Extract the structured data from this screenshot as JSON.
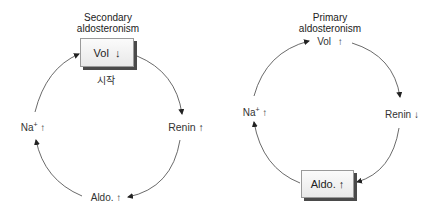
{
  "diagrams": [
    {
      "title_line1": "Secondary",
      "title_line2": "aldosteronism",
      "start_label": "시작",
      "nodes": {
        "vol": {
          "name": "Vol",
          "arrow": "↓",
          "boxed": true
        },
        "renin": {
          "name": "Renin",
          "arrow": "↑",
          "boxed": false
        },
        "aldo": {
          "name": "Aldo.",
          "arrow": "↑",
          "boxed": false
        },
        "na": {
          "name": "Na",
          "superscript": "+",
          "arrow": "↑",
          "boxed": false
        }
      },
      "cycle_order": [
        "vol",
        "renin",
        "aldo",
        "na"
      ]
    },
    {
      "title_line1": "Primary",
      "title_line2": "aldosteronism",
      "nodes": {
        "vol": {
          "name": "Vol",
          "arrow": "↑",
          "boxed": false
        },
        "renin": {
          "name": "Renin",
          "arrow": "↓",
          "boxed": false
        },
        "aldo": {
          "name": "Aldo.",
          "arrow": "↑",
          "boxed": true
        },
        "na": {
          "name": "Na",
          "superscript": "+",
          "arrow": "↑",
          "boxed": false
        }
      },
      "cycle_order": [
        "vol",
        "renin",
        "aldo",
        "na"
      ]
    }
  ]
}
